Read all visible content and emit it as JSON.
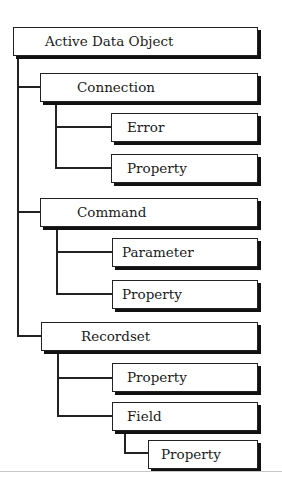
{
  "diagram": {
    "type": "object-hierarchy",
    "root": {
      "label": "Active Data Object",
      "children": [
        {
          "label": "Connection",
          "children": [
            {
              "label": "Error"
            },
            {
              "label": "Property"
            }
          ]
        },
        {
          "label": "Command",
          "children": [
            {
              "label": "Parameter"
            },
            {
              "label": "Property"
            }
          ]
        },
        {
          "label": "Recordset",
          "children": [
            {
              "label": "Property"
            },
            {
              "label": "Field",
              "children": [
                {
                  "label": "Property"
                }
              ]
            }
          ]
        }
      ]
    },
    "nodes": {
      "root": "Active Data Object",
      "connection": "Connection",
      "connection_error": "Error",
      "connection_property": "Property",
      "command": "Command",
      "command_parameter": "Parameter",
      "command_property": "Property",
      "recordset": "Recordset",
      "recordset_property": "Property",
      "recordset_field": "Field",
      "field_property": "Property"
    }
  }
}
